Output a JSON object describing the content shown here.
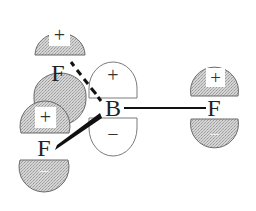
{
  "diagram": {
    "central_atom": {
      "label": "B",
      "orbital": {
        "upper_sign": "+",
        "lower_sign": "−",
        "fill": "#ffffff"
      }
    },
    "fluorine_atoms": [
      {
        "label": "F",
        "position": "back-left",
        "bond": "dashed-wedge",
        "upper_sign": "+",
        "lower_sign": "−"
      },
      {
        "label": "F",
        "position": "front-left",
        "bond": "solid-wedge",
        "upper_sign": "+",
        "lower_sign": "−"
      },
      {
        "label": "F",
        "position": "right",
        "bond": "line",
        "upper_sign": "+",
        "lower_sign": "−"
      }
    ],
    "colors": {
      "lobe_fill": "#cfcfcf",
      "lobe_stroke": "#6b6b6b",
      "bond": "#111111",
      "text": "#222222",
      "sign_box": "#ffffff"
    }
  }
}
